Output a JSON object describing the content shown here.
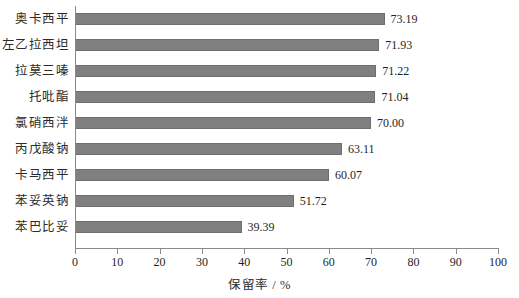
{
  "chart_data": {
    "type": "bar",
    "orientation": "horizontal",
    "title": "",
    "xlabel": "保留率 / %",
    "ylabel": "",
    "xlim": [
      0,
      100
    ],
    "xticks": [
      0,
      10,
      20,
      30,
      40,
      50,
      60,
      70,
      80,
      90,
      100
    ],
    "grid": false,
    "legend": null,
    "bar_color": "#808080",
    "bar_edge_color": "#6e6e6e",
    "axis_color": "#8a8a8a",
    "categories": [
      "奥卡西平",
      "左乙拉西坦",
      "拉莫三嗪",
      "托吡酯",
      "氯硝西泮",
      "丙戊酸钠",
      "卡马西平",
      "苯妥英钠",
      "苯巴比妥"
    ],
    "values": [
      73.19,
      71.93,
      71.22,
      71.04,
      70.0,
      63.11,
      60.07,
      51.72,
      39.39
    ],
    "value_labels": [
      "73.19",
      "71.93",
      "71.22",
      "71.04",
      "70.00",
      "63.11",
      "60.07",
      "51.72",
      "39.39"
    ]
  }
}
